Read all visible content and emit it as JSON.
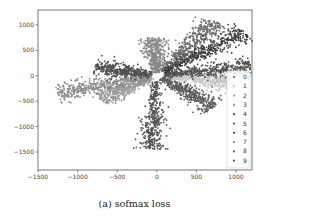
{
  "chart_data": {
    "type": "scatter",
    "title": "",
    "caption": "(a)  sofmax loss",
    "xlabel": "",
    "ylabel": "",
    "xlim": [
      -1500,
      1150
    ],
    "ylim": [
      -1750,
      1300
    ],
    "x_ticks": [
      -1500,
      -1000,
      -500,
      0,
      500,
      1000
    ],
    "y_ticks": [
      1000,
      500,
      0,
      -500,
      -1000,
      -1500
    ],
    "grid": false,
    "legend_position": "right",
    "legend": [
      "0",
      "1",
      "2",
      "3",
      "4",
      "5",
      "6",
      "7",
      "8",
      "9"
    ],
    "series": [
      {
        "name": "0",
        "color": "#6a6a6a",
        "arm_angle_deg": 55,
        "arm_length": 1300,
        "description": "elongated cluster toward upper-right"
      },
      {
        "name": "1",
        "color": "#c4c4c4",
        "arm_angle_deg": -7,
        "arm_length": 1000,
        "description": "light cluster toward right, slightly below x-axis"
      },
      {
        "name": "2",
        "color": "#9a9a9a",
        "arm_angle_deg": -148,
        "arm_length": 850,
        "description": "cluster toward lower-left"
      },
      {
        "name": "3",
        "color": "#8c8c8c",
        "arm_angle_deg": -165,
        "arm_length": 1300,
        "description": "cluster toward left, below x-axis"
      },
      {
        "name": "4",
        "color": "#505050",
        "arm_angle_deg": 8,
        "arm_length": 1200,
        "description": "cluster toward right, just above x-axis"
      },
      {
        "name": "5",
        "color": "#505050",
        "arm_angle_deg": 168,
        "arm_length": 800,
        "description": "cluster toward left, just above x-axis"
      },
      {
        "name": "6",
        "color": "#3d3d3d",
        "arm_angle_deg": 38,
        "arm_length": 1400,
        "description": "dark cluster toward upper-right"
      },
      {
        "name": "7",
        "color": "#888888",
        "arm_angle_deg": 93,
        "arm_length": 750,
        "description": "short cluster pointing up"
      },
      {
        "name": "8",
        "color": "#5c5c5c",
        "arm_angle_deg": -40,
        "arm_length": 950,
        "description": "cluster toward lower-right"
      },
      {
        "name": "9",
        "color": "#555555",
        "arm_angle_deg": -93,
        "arm_length": 1450,
        "description": "long cluster pointing down"
      }
    ],
    "note": "Ten radial clusters of points (one per class label 0-9) emanating from origin; each arm approx 1000-1500 units long with spread of ~60-150 units."
  }
}
